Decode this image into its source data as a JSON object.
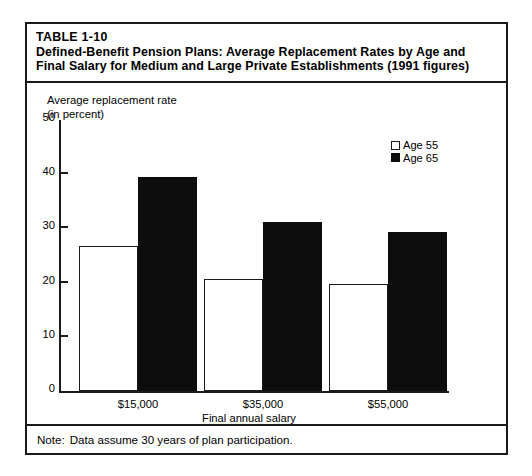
{
  "title": {
    "table_number": "TABLE 1-10",
    "line1": "Defined-Benefit Pension Plans:  Average Replacement Rates by Age and",
    "line2": "Final Salary for Medium and Large Private Establishments (1991 figures)"
  },
  "y_axis_title": {
    "line1": "Average replacement rate",
    "line2": "(in percent)"
  },
  "legend": [
    {
      "label": "Age 55",
      "swatch": "hollow-square-icon",
      "color": "#ffffff"
    },
    {
      "label": "Age 65",
      "swatch": "filled-square-icon",
      "color": "#0d0d0d"
    }
  ],
  "note": {
    "label": "Note:",
    "text": "Data assume 30 years of plan participation."
  },
  "chart_data": {
    "type": "bar",
    "title": "Defined-Benefit Pension Plans:  Average Replacement Rates by Age and Final Salary for Medium and Large Private Establishments (1991 figures)",
    "xlabel": "Final annual salary",
    "ylabel": "Average replacement rate (in percent)",
    "categories": [
      "$15,000",
      "$35,000",
      "$55,000"
    ],
    "series": [
      {
        "name": "Age 55",
        "values": [
          26.7,
          20.7,
          19.7
        ]
      },
      {
        "name": "Age 65",
        "values": [
          39.5,
          31.1,
          29.4
        ]
      }
    ],
    "ylim": [
      0,
      50
    ],
    "yticks": [
      0,
      10,
      20,
      30,
      40,
      50
    ],
    "ytick_labels": [
      "0",
      "10",
      "20",
      "30",
      "40",
      "50"
    ],
    "grid": false,
    "legend_position": "top-right"
  }
}
